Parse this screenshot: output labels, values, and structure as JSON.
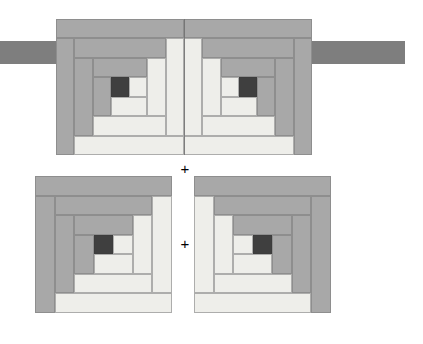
{
  "diagram": {
    "canvas": {
      "width": 423,
      "height": 344,
      "background": "#ffffff"
    },
    "palette": {
      "light": "#eeeeea",
      "light_alt": "#e6e6e2",
      "medium": "#a8a8a8",
      "medium_dark": "#9a9a9a",
      "dark_bar": "#7e7e7e",
      "center": "#3f3f3f",
      "outline": "#787878"
    },
    "symbols": [
      {
        "name": "plus-sign-top",
        "glyph": "+",
        "x": 177,
        "y": 161
      },
      {
        "name": "plus-sign-bottom",
        "glyph": "+",
        "x": 177,
        "y": 236
      }
    ],
    "sashing": {
      "name": "horizontal-sashing-strip",
      "color": "#7e7e7e",
      "x": 0,
      "y": 41,
      "width": 405,
      "height": 23
    },
    "top_assembly": {
      "name": "top-joined-block-pair",
      "x": 56,
      "y": 19,
      "width": 256,
      "height": 136,
      "center_seam_x": 184
    },
    "blocks": [
      {
        "name": "top-left-block",
        "orientation": "mirrored-horizontal",
        "x": 56,
        "y": 19,
        "width": 128,
        "height": 136
      },
      {
        "name": "top-right-block",
        "orientation": "normal",
        "x": 184,
        "y": 19,
        "width": 128,
        "height": 136
      },
      {
        "name": "bottom-left-block",
        "orientation": "mirrored-horizontal",
        "x": 35,
        "y": 176,
        "width": 137,
        "height": 137
      },
      {
        "name": "bottom-right-block",
        "orientation": "normal",
        "x": 194,
        "y": 176,
        "width": 137,
        "height": 137
      }
    ],
    "block_pieces_unit": [
      {
        "name": "center-square",
        "tone": "center",
        "x": 3,
        "y": 3,
        "w": 1,
        "h": 1
      },
      {
        "name": "log-1-light",
        "tone": "light",
        "x": 2,
        "y": 3,
        "w": 1,
        "h": 1
      },
      {
        "name": "log-2-light",
        "tone": "light",
        "x": 2,
        "y": 4,
        "w": 2,
        "h": 1
      },
      {
        "name": "log-3-medium",
        "tone": "medium",
        "x": 4,
        "y": 3,
        "w": 1,
        "h": 2
      },
      {
        "name": "log-4-medium",
        "tone": "medium",
        "x": 2,
        "y": 2,
        "w": 3,
        "h": 1
      },
      {
        "name": "log-5-light",
        "tone": "light",
        "x": 1,
        "y": 2,
        "w": 1,
        "h": 3
      },
      {
        "name": "log-6-light",
        "tone": "light",
        "x": 1,
        "y": 5,
        "w": 4,
        "h": 1
      },
      {
        "name": "log-7-medium",
        "tone": "medium",
        "x": 5,
        "y": 2,
        "w": 1,
        "h": 4
      },
      {
        "name": "log-8-medium",
        "tone": "medium",
        "x": 1,
        "y": 1,
        "w": 5,
        "h": 1
      },
      {
        "name": "log-9-light",
        "tone": "light",
        "x": 0,
        "y": 1,
        "w": 1,
        "h": 5
      },
      {
        "name": "log-10-light",
        "tone": "light",
        "x": 0,
        "y": 6,
        "w": 6,
        "h": 1
      },
      {
        "name": "log-11-medium",
        "tone": "medium",
        "x": 6,
        "y": 1,
        "w": 1,
        "h": 6
      },
      {
        "name": "log-12-medium",
        "tone": "medium",
        "x": 0,
        "y": 0,
        "w": 7,
        "h": 1
      }
    ]
  }
}
